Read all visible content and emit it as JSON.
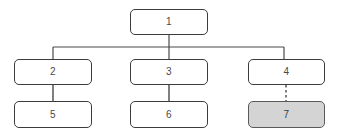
{
  "diagram": {
    "type": "tree-hierarchy",
    "background_color": "#ffffff",
    "node_border_color": "#3c3c3c",
    "node_fill_color": "#ffffff",
    "highlight_fill_color": "#d4d4d4",
    "connector_color": "#4a4a4a",
    "nodes": [
      {
        "id": "1",
        "label": "1",
        "x": 130,
        "y": 9,
        "w": 78,
        "h": 26,
        "highlighted": false
      },
      {
        "id": "2",
        "label": "2",
        "x": 14,
        "y": 59,
        "w": 78,
        "h": 26,
        "highlighted": false
      },
      {
        "id": "3",
        "label": "3",
        "x": 130,
        "y": 59,
        "w": 78,
        "h": 26,
        "highlighted": false
      },
      {
        "id": "4",
        "label": "4",
        "x": 248,
        "y": 59,
        "w": 77,
        "h": 26,
        "highlighted": false
      },
      {
        "id": "5",
        "label": "5",
        "x": 14,
        "y": 101,
        "w": 78,
        "h": 27,
        "highlighted": false
      },
      {
        "id": "6",
        "label": "6",
        "x": 130,
        "y": 101,
        "w": 78,
        "h": 27,
        "highlighted": false
      },
      {
        "id": "7",
        "label": "7",
        "x": 248,
        "y": 101,
        "w": 77,
        "h": 27,
        "highlighted": true
      }
    ],
    "edges": [
      {
        "from": "1",
        "to": "trunk",
        "style": "solid"
      },
      {
        "from": "trunk",
        "to": "2",
        "style": "solid"
      },
      {
        "from": "trunk",
        "to": "3",
        "style": "solid"
      },
      {
        "from": "trunk",
        "to": "4",
        "style": "solid"
      },
      {
        "from": "2",
        "to": "5",
        "style": "solid"
      },
      {
        "from": "3",
        "to": "6",
        "style": "solid"
      },
      {
        "from": "4",
        "to": "7",
        "style": "dashed"
      }
    ],
    "trunk": {
      "y": 47,
      "x_start": 53,
      "x_end": 284
    }
  }
}
